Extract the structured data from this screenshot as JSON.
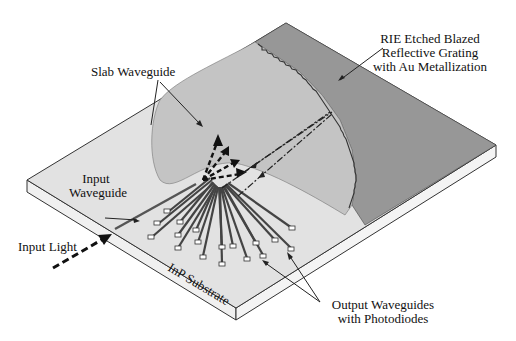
{
  "diagram": {
    "type": "device-schematic",
    "labels": {
      "grating_line1": "RIE Etched Blazed",
      "grating_line2": "Reflective Grating",
      "grating_line3": "with Au Metallization",
      "slab": "Slab Waveguide",
      "input_wg_line1": "Input",
      "input_wg_line2": "Waveguide",
      "input_light": "Input Light",
      "substrate": "InP Substrate",
      "output_line1": "Output Waveguides",
      "output_line2": "with Photodiodes"
    },
    "colors": {
      "substrate_top": "#e4e4e4",
      "substrate_side": "#f2f2f2",
      "slab": "#c4c4c4",
      "grating_region": "#969696",
      "outline": "#333333",
      "waveguide": "#555555",
      "arrow": "#111111"
    },
    "output_waveguide_count": 18
  }
}
